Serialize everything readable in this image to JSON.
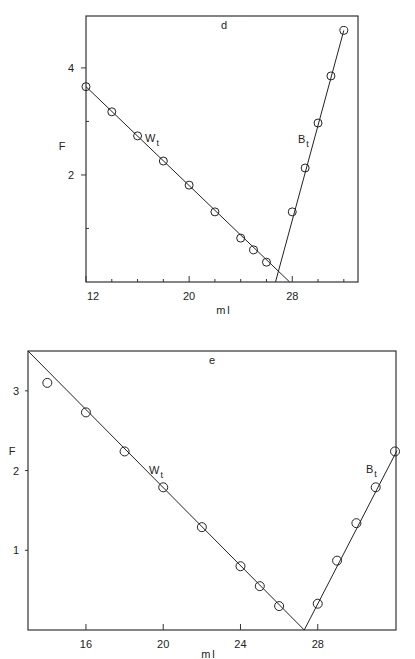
{
  "chart_data": [
    {
      "panel": "d",
      "type": "scatter",
      "title": "d",
      "xlabel": "ml",
      "ylabel": "F",
      "xlim": [
        12,
        33
      ],
      "ylim": [
        0,
        4.8
      ],
      "x_ticks": [
        12,
        20,
        28
      ],
      "y_ticks": [
        2,
        4
      ],
      "grid": false,
      "series": [
        {
          "name": "Wt",
          "label_main": "W",
          "label_sub": "t",
          "x": [
            12,
            14,
            16,
            18,
            20,
            22,
            24,
            25,
            26
          ],
          "y": [
            3.65,
            3.18,
            2.73,
            2.26,
            1.81,
            1.31,
            0.82,
            0.6,
            0.37
          ],
          "fit_line": {
            "x": [
              12,
              27.8
            ],
            "y": [
              3.65,
              0
            ]
          }
        },
        {
          "name": "Bt",
          "label_main": "B",
          "label_sub": "t",
          "x": [
            28,
            29,
            30,
            31,
            32
          ],
          "y": [
            1.31,
            2.13,
            2.97,
            3.85,
            4.7
          ],
          "fit_line": {
            "x": [
              26.7,
              32
            ],
            "y": [
              0,
              4.7
            ]
          }
        }
      ]
    },
    {
      "panel": "e",
      "type": "scatter",
      "title": "e",
      "xlabel": "ml",
      "ylabel": "F",
      "xlim": [
        13,
        32.1
      ],
      "ylim": [
        0,
        3.5
      ],
      "x_ticks": [
        16,
        20,
        24,
        28
      ],
      "y_ticks": [
        1,
        2,
        3
      ],
      "grid": false,
      "series": [
        {
          "name": "Wt",
          "label_main": "W",
          "label_sub": "t",
          "x": [
            14,
            16,
            18,
            20,
            22,
            24,
            25,
            26
          ],
          "y": [
            3.1,
            2.73,
            2.24,
            1.79,
            1.29,
            0.8,
            0.55,
            0.3
          ],
          "fit_line": {
            "x": [
              13,
              27.3
            ],
            "y": [
              3.5,
              0
            ]
          }
        },
        {
          "name": "Bt",
          "label_main": "B",
          "label_sub": "t",
          "x": [
            28,
            29,
            30,
            31,
            32
          ],
          "y": [
            0.33,
            0.87,
            1.34,
            1.79,
            2.24
          ],
          "fit_line": {
            "x": [
              27.3,
              32.1
            ],
            "y": [
              0,
              2.25
            ]
          }
        }
      ]
    }
  ],
  "layout": {
    "panels": [
      {
        "left": 86,
        "right": 358,
        "top": 16,
        "bottom": 282,
        "xmin": 12,
        "xmax": 33.1,
        "ymin": 0,
        "ymax": 4.97
      },
      {
        "left": 28,
        "right": 396,
        "top": 351,
        "bottom": 630,
        "xmin": 13,
        "xmax": 32.05,
        "ymin": 0,
        "ymax": 3.5
      }
    ],
    "minor_x_ticks_d": [
      14,
      16,
      18,
      22,
      24,
      26,
      30,
      32
    ],
    "minor_y_ticks_d": [
      1,
      3
    ]
  }
}
